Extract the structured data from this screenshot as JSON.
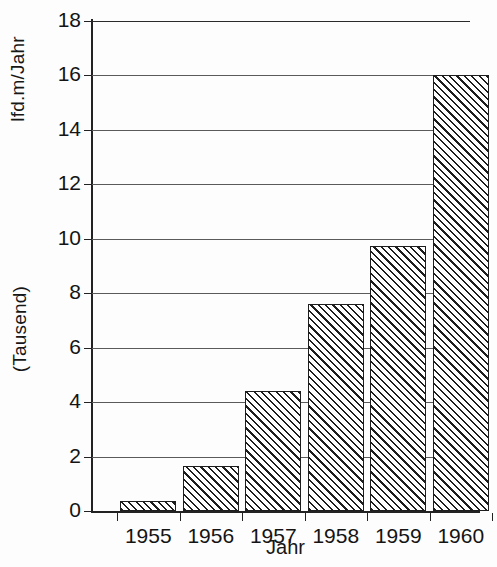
{
  "chart_data": {
    "type": "bar",
    "title": "",
    "xlabel": "Jahr",
    "ylabel": "lfd.m/Jahr (Tausend)",
    "ylabel_line1": "lfd.m/Jahr",
    "ylabel_line2": "(Tausend)",
    "categories": [
      "1955",
      "1956",
      "1957",
      "1958",
      "1959",
      "1960"
    ],
    "values": [
      0.35,
      1.65,
      4.4,
      7.6,
      9.75,
      16.0
    ],
    "series": [
      {
        "name": "lfd.m/Jahr (Tausend)",
        "values": [
          0.35,
          1.65,
          4.4,
          7.6,
          9.75,
          16.0
        ]
      }
    ],
    "ylim": [
      0,
      18
    ],
    "yticks": [
      0,
      2,
      4,
      6,
      8,
      10,
      12,
      14,
      16,
      18
    ],
    "ytick_labels": [
      "0",
      "2",
      "4",
      "6",
      "8",
      "10",
      "12",
      "14",
      "16",
      "18"
    ],
    "grid": true,
    "grid_axis": "y",
    "legend": false,
    "legend_position": "none",
    "bar_fill": "hatched-diagonal",
    "bar_edge_color": "#1d1d1d",
    "bar_face_color": "#ffffff",
    "background_color": "#fdfdfd",
    "gridline_color": "#5a5a5a",
    "axis_color": "#222222"
  }
}
